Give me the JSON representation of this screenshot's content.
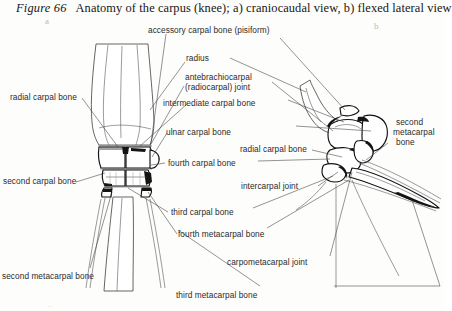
{
  "figure": {
    "number_label": "Figure 66",
    "caption": "Anatomy of the carpus (knee); a) craniocaudal view, b) flexed lateral view",
    "panel_a_letter": "a",
    "panel_b_letter": "b",
    "bottom_faint_mark": "..",
    "ink_color": "#111111",
    "leader_color": "#3a3a3a",
    "label_color": "#2b2b2b",
    "background": "#fdfdfc"
  },
  "labels": {
    "accessory_carpal_bone": "accessory carpal bone (pisiform)",
    "radius": "radius",
    "antebrachiocarpal_line1": "antebrachiocarpal",
    "antebrachiocarpal_line2": "(radiocarpal) joint",
    "intermediate_carpal_bone": "intermediate carpal bone",
    "ulnar_carpal_bone": "ulnar carpal bone",
    "radial_carpal_bone_left": "radial carpal bone",
    "radial_carpal_bone_right": "radial carpal bone",
    "fourth_carpal_bone": "fourth carpal bone",
    "second_carpal_bone": "second carpal bone",
    "intercarpal_joint": "intercarpal joint",
    "third_carpal_bone": "third carpal bone",
    "fourth_metacarpal_bone": "fourth metacarpal bone",
    "carpometacarpal_joint": "carpometacarpal joint",
    "second_metacarpal_bone_left": "second metacarpal bone",
    "second_metacarpal_right_l1": "second",
    "second_metacarpal_right_l2": "metacarpal",
    "second_metacarpal_right_l3": "bone",
    "third_metacarpal_bone": "third metacarpal bone"
  }
}
